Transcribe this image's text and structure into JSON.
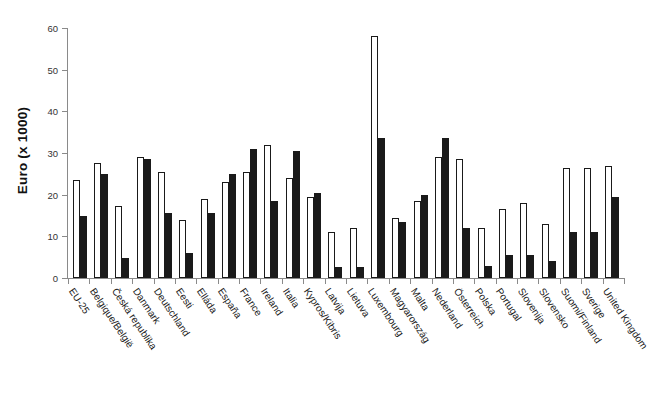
{
  "chart_data": {
    "type": "bar",
    "title": "",
    "xlabel": "",
    "ylabel": "Euro (x 1000)",
    "ylim": [
      0,
      60
    ],
    "yticks": [
      0,
      10,
      20,
      30,
      40,
      50,
      60
    ],
    "grid": false,
    "legend": "none",
    "categories": [
      "EU-25",
      "Belgique/België",
      "Česká republika",
      "Danmark",
      "Deutschland",
      "Eesti",
      "Elláda",
      "España",
      "France",
      "Ireland",
      "Italia",
      "Kypros/Kibris",
      "Latvija",
      "Lietuva",
      "Luxembourg",
      "Magyarország",
      "Malta",
      "Nederland",
      "Österreich",
      "Polska",
      "Portugal",
      "Slovenija",
      "Slovensko",
      "Suomi/Finland",
      "Sverige",
      "United Kingdom"
    ],
    "series": [
      {
        "name": "white",
        "color": "#ffffff",
        "values": [
          23.5,
          27.5,
          17.2,
          29.0,
          25.5,
          14.0,
          19.0,
          23.0,
          25.5,
          32.0,
          24.0,
          19.5,
          11.0,
          12.0,
          58.0,
          14.5,
          18.5,
          29.0,
          28.5,
          12.0,
          16.5,
          18.0,
          13.0,
          26.5,
          26.5,
          26.8
        ]
      },
      {
        "name": "black",
        "color": "#1a1a1a",
        "values": [
          15.0,
          25.0,
          4.8,
          28.5,
          15.5,
          6.0,
          15.5,
          25.0,
          31.0,
          18.5,
          30.5,
          20.5,
          2.6,
          2.6,
          33.5,
          13.5,
          20.0,
          33.5,
          12.0,
          2.8,
          5.5,
          5.5,
          4.0,
          11.0,
          11.0,
          19.5
        ]
      }
    ]
  }
}
